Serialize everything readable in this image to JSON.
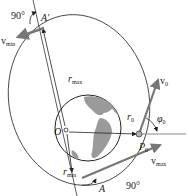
{
  "figure": {
    "type": "orbital-mechanics-diagram",
    "labels": {
      "apogee": "A′",
      "perigee": "A",
      "focus": "O",
      "launch_point": "P",
      "launch_point_sub": "0",
      "r_max": "r",
      "r_max_sub": "max",
      "r_min": "r",
      "r_min_sub": "min",
      "r0": "r",
      "r0_sub": "0",
      "v0": "v",
      "v0_sub": "0",
      "v_max": "v",
      "v_max_sub": "max",
      "v_min": "v",
      "v_min_sub": "min",
      "phi0": "φ",
      "phi0_sub": "0",
      "angle_top": "90°",
      "angle_bottom": "90°"
    },
    "colors": {
      "line": "#333333",
      "earth_ocean": "#ffffff",
      "earth_land": "#9a9a9a",
      "vector": "#7a7a7a",
      "point": "#b0b0b0"
    }
  }
}
